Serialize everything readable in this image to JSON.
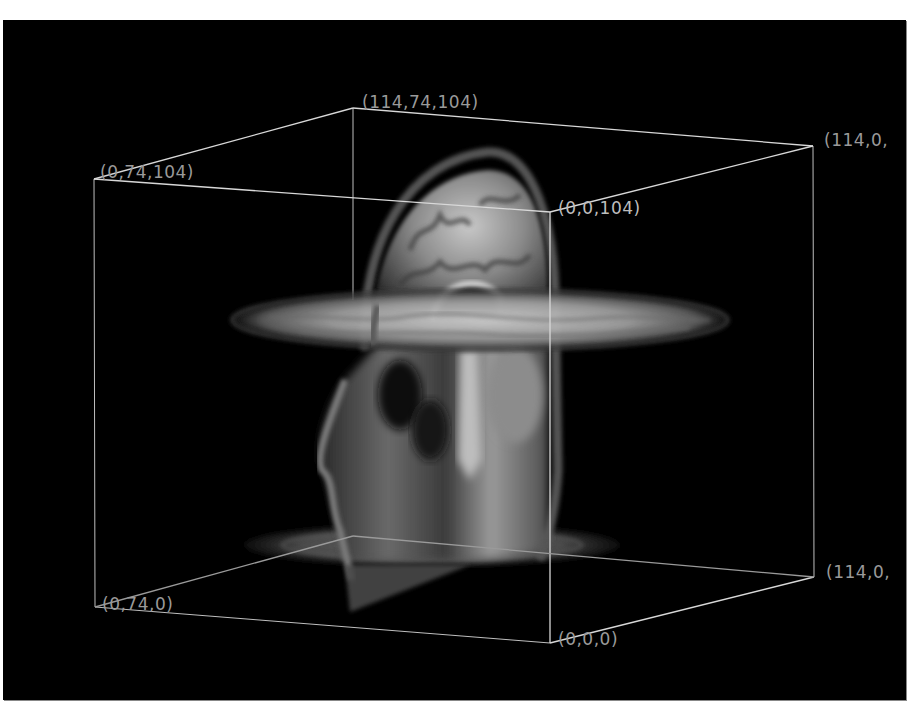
{
  "scene": {
    "background": "#000000",
    "page_background": "#ffffff",
    "box_line_color": "#d8d8d8",
    "description": "3D volume rendering of MRI head with sagittal and two axial slices inside a wireframe bounding box"
  },
  "bounding_box": {
    "corners": [
      {
        "id": "x0_y74_z104",
        "label": "(0,74,104)",
        "px": [
          94,
          179
        ]
      },
      {
        "id": "x114_y74_z104",
        "label": "(114,74,104)",
        "px": [
          353,
          108
        ]
      },
      {
        "id": "x114_y0_z104",
        "label": "(114,0,",
        "px": [
          813,
          146
        ]
      },
      {
        "id": "x0_y0_z104",
        "label": "(0,0,104)",
        "px": [
          550,
          212
        ]
      },
      {
        "id": "x0_y74_z0",
        "label": "(0,74,0)",
        "px": [
          95,
          607
        ]
      },
      {
        "id": "x0_y0_z0",
        "label": "(0,0,0)",
        "px": [
          550,
          643
        ]
      },
      {
        "id": "x114_y0_z0",
        "label": "(114,0,",
        "px": [
          814,
          577
        ]
      }
    ]
  },
  "labels": {
    "top_back": "(114,74,104)",
    "top_left": "(0,74,104)",
    "top_right": "(114,0,",
    "top_front": "(0,0,104)",
    "bottom_left": "(0,74,0)",
    "bottom_front": "(0,0,0)",
    "bottom_right": "(114,0,"
  },
  "slices": {
    "sagittal": "head-sagittal-slice",
    "axial_upper": "axial-slice-upper",
    "axial_lower": "axial-slice-lower"
  }
}
